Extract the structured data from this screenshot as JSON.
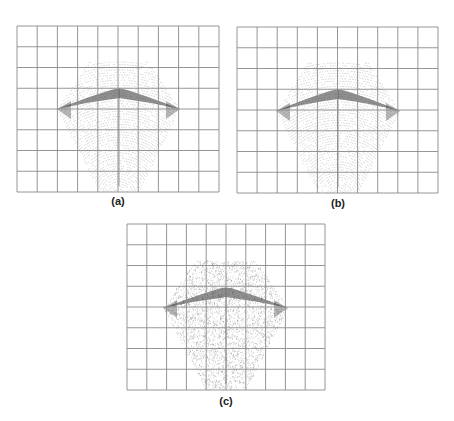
{
  "figure": {
    "panels": [
      {
        "id": "a",
        "caption": "(a)",
        "grid": {
          "x": 17,
          "y": 26,
          "width": 202,
          "height": 166,
          "cols": 10,
          "rows": 8
        },
        "shape": {
          "top_y": 62,
          "top_left_x": 89,
          "top_right_x": 148,
          "mid_y": 109,
          "left_x": 57,
          "right_x": 180,
          "bottom_y": 192,
          "bottom_left_x": 99,
          "bottom_right_x": 139,
          "peak_x": 119,
          "peak_y": 89,
          "texture": "dotted-arcs"
        },
        "caption_pos": {
          "x": 118,
          "y": 195
        }
      },
      {
        "id": "b",
        "caption": "(b)",
        "grid": {
          "x": 237,
          "y": 27,
          "width": 201,
          "height": 166,
          "cols": 10,
          "rows": 8
        },
        "shape": {
          "top_y": 63,
          "top_left_x": 308,
          "top_right_x": 368,
          "mid_y": 111,
          "left_x": 276,
          "right_x": 400,
          "bottom_y": 193,
          "bottom_left_x": 318,
          "bottom_right_x": 358,
          "peak_x": 338,
          "peak_y": 90,
          "texture": "dotted-arcs"
        },
        "caption_pos": {
          "x": 338,
          "y": 197
        }
      },
      {
        "id": "c",
        "caption": "(c)",
        "grid": {
          "x": 127,
          "y": 224,
          "width": 198,
          "height": 166,
          "cols": 10,
          "rows": 8
        },
        "shape": {
          "top_y": 261,
          "top_left_x": 195,
          "top_right_x": 256,
          "mid_y": 308,
          "left_x": 163,
          "right_x": 288,
          "bottom_y": 390,
          "bottom_left_x": 206,
          "bottom_right_x": 246,
          "peak_x": 226,
          "peak_y": 288,
          "texture": "random-dots"
        },
        "caption_pos": {
          "x": 226,
          "y": 395
        }
      }
    ],
    "colors": {
      "grid_line": "#8a8a8a",
      "dots": "#555555",
      "ridge": "#333333",
      "caption": "#222222"
    }
  }
}
